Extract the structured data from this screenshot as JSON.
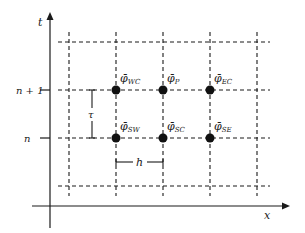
{
  "diagram": {
    "axes": {
      "y_label": "t",
      "x_label": "x",
      "y_ticks": [
        {
          "label": "n + 1",
          "y": 90
        },
        {
          "label": "n",
          "y": 138
        }
      ]
    },
    "grid": {
      "vertical_x": [
        69,
        116,
        163,
        210,
        257
      ],
      "horizontal_y": [
        42,
        90,
        138,
        186
      ],
      "line_style": "dashed",
      "color": "#1a1a1a"
    },
    "nodes": [
      {
        "id": "WC",
        "symbol": "φ̄",
        "sub": "WC",
        "x": 116,
        "y": 90
      },
      {
        "id": "P",
        "symbol": "φ̄",
        "sub": "P",
        "x": 163,
        "y": 90
      },
      {
        "id": "EC",
        "symbol": "φ̄",
        "sub": "EC",
        "x": 210,
        "y": 90
      },
      {
        "id": "SW",
        "symbol": "φ̄",
        "sub": "SW",
        "x": 116,
        "y": 138
      },
      {
        "id": "SC",
        "symbol": "φ̄",
        "sub": "SC",
        "x": 163,
        "y": 138
      },
      {
        "id": "SE",
        "symbol": "φ̄",
        "sub": "SE",
        "x": 210,
        "y": 138
      }
    ],
    "spacing": {
      "time_step": "τ",
      "space_step": "h"
    }
  }
}
